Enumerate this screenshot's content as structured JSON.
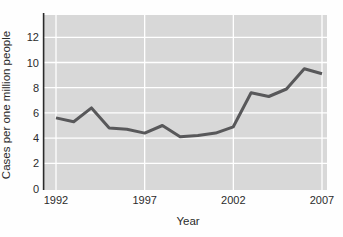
{
  "chart_data": {
    "type": "line",
    "title": "",
    "xlabel": "Year",
    "ylabel": "Cases per one million people",
    "x": [
      1992,
      1993,
      1994,
      1995,
      1996,
      1997,
      1998,
      1999,
      2000,
      2001,
      2002,
      2003,
      2004,
      2005,
      2006,
      2007
    ],
    "values": [
      5.6,
      5.3,
      6.4,
      4.8,
      4.7,
      4.4,
      5.0,
      4.1,
      4.2,
      4.4,
      4.9,
      7.6,
      7.3,
      7.9,
      9.5,
      9.1
    ],
    "xticks": [
      1992,
      1997,
      2002,
      2007
    ],
    "yticks": [
      0,
      2,
      4,
      6,
      8,
      10,
      12
    ],
    "xlim": [
      1992,
      2007
    ],
    "ylim": [
      0,
      13.8
    ],
    "grid": true,
    "legend": false,
    "colors": {
      "plot_background": "#d8d8d8",
      "gridline": "#ffffff",
      "line": "#58585a",
      "axis": "#2a2a2a",
      "text": "#2b2b2b"
    }
  }
}
